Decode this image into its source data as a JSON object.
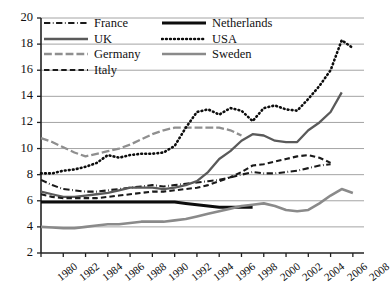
{
  "chart_data": {
    "type": "line",
    "title": "",
    "xlabel": "",
    "ylabel": "share of national income (%)",
    "xlim": [
      1980,
      2009
    ],
    "ylim": [
      2,
      20
    ],
    "ytick_values": [
      2,
      4,
      6,
      8,
      10,
      12,
      14,
      16,
      18,
      20
    ],
    "xtick_values": [
      1980,
      1982,
      1984,
      1986,
      1988,
      1990,
      1992,
      1994,
      1996,
      1998,
      2000,
      2002,
      2004,
      2006,
      2008
    ],
    "ytick_labels": [
      "2",
      "4",
      "6",
      "8",
      "10",
      "12",
      "14",
      "16",
      "18",
      "20"
    ],
    "xtick_labels": [
      "1980",
      "1982",
      "1984",
      "1986",
      "1988",
      "1990",
      "1992",
      "1994",
      "1996",
      "1998",
      "2000",
      "2002",
      "2004",
      "2006",
      "2008"
    ],
    "grid": "horizontal",
    "legend_position": "top-left",
    "series": [
      {
        "name": "France",
        "color": "#1a1a1a",
        "style": "dash-dot",
        "width": 2.1,
        "x": [
          1980,
          1981,
          1982,
          1983,
          1984,
          1985,
          1986,
          1987,
          1988,
          1989,
          1990,
          1991,
          1992,
          1993,
          1994,
          1995,
          1996,
          1997,
          1998,
          1999,
          2000,
          2001,
          2002,
          2003,
          2004,
          2005,
          2006
        ],
        "y": [
          7.6,
          7.2,
          6.9,
          6.8,
          6.7,
          6.7,
          6.8,
          6.9,
          7.0,
          7.1,
          7.2,
          7.1,
          7.2,
          7.3,
          7.4,
          7.5,
          7.6,
          7.8,
          8.0,
          8.2,
          8.1,
          8.1,
          8.2,
          8.3,
          8.5,
          8.7,
          8.8
        ]
      },
      {
        "name": "UK",
        "color": "#5a5a5a",
        "style": "solid",
        "width": 2.3,
        "x": [
          1980,
          1981,
          1982,
          1983,
          1984,
          1985,
          1986,
          1987,
          1988,
          1989,
          1990,
          1991,
          1992,
          1993,
          1994,
          1995,
          1996,
          1997,
          1998,
          1999,
          2000,
          2001,
          2002,
          2003,
          2004,
          2005,
          2006,
          2007
        ],
        "y": [
          6.7,
          6.5,
          6.3,
          6.3,
          6.4,
          6.5,
          6.6,
          6.8,
          7.0,
          7.0,
          7.0,
          6.9,
          7.0,
          7.2,
          7.5,
          8.2,
          9.2,
          9.8,
          10.6,
          11.1,
          11.0,
          10.6,
          10.5,
          10.5,
          11.4,
          12.0,
          12.8,
          14.3
        ]
      },
      {
        "name": "Germany",
        "color": "#8f8f8f",
        "style": "long-dash",
        "width": 2.3,
        "x": [
          1980,
          1981,
          1982,
          1983,
          1984,
          1985,
          1986,
          1987,
          1988,
          1989,
          1990,
          1991,
          1992,
          1993,
          1994,
          1995,
          1996,
          1997,
          1998
        ],
        "y": [
          10.8,
          10.5,
          10.1,
          9.7,
          9.4,
          9.6,
          9.8,
          10.0,
          10.3,
          10.7,
          11.1,
          11.4,
          11.6,
          11.6,
          11.6,
          11.6,
          11.6,
          11.4,
          11.0
        ]
      },
      {
        "name": "Italy",
        "color": "#1a1a1a",
        "style": "dash",
        "width": 2.1,
        "x": [
          1980,
          1981,
          1982,
          1983,
          1984,
          1985,
          1986,
          1987,
          1988,
          1989,
          1990,
          1991,
          1992,
          1993,
          1994,
          1995,
          1996,
          1997,
          1998,
          1999,
          2000,
          2001,
          2002,
          2003,
          2004,
          2005,
          2006
        ],
        "y": [
          6.5,
          6.3,
          6.2,
          6.2,
          6.2,
          6.2,
          6.3,
          6.4,
          6.5,
          6.6,
          6.7,
          6.7,
          6.8,
          6.9,
          7.0,
          7.2,
          7.5,
          7.8,
          8.2,
          8.7,
          8.8,
          9.0,
          9.2,
          9.4,
          9.5,
          9.3,
          8.9
        ]
      },
      {
        "name": "Netherlands",
        "color": "#0d0d0d",
        "style": "solid",
        "width": 3.0,
        "x": [
          1980,
          1981,
          1982,
          1983,
          1984,
          1985,
          1986,
          1987,
          1988,
          1989,
          1990,
          1991,
          1992,
          1993,
          1994,
          1995,
          1996,
          1997,
          1998,
          1999
        ],
        "y": [
          5.9,
          5.9,
          5.9,
          5.9,
          5.9,
          5.9,
          5.9,
          5.9,
          5.9,
          5.9,
          5.9,
          5.9,
          5.9,
          5.8,
          5.7,
          5.6,
          5.5,
          5.5,
          5.5,
          5.5
        ]
      },
      {
        "name": "USA",
        "color": "#0d0d0d",
        "style": "dot",
        "width": 2.6,
        "x": [
          1980,
          1981,
          1982,
          1983,
          1984,
          1985,
          1986,
          1987,
          1988,
          1989,
          1990,
          1991,
          1992,
          1993,
          1994,
          1995,
          1996,
          1997,
          1998,
          1999,
          2000,
          2001,
          2002,
          2003,
          2004,
          2005,
          2006,
          2007,
          2008
        ],
        "y": [
          8.1,
          8.1,
          8.3,
          8.4,
          8.6,
          8.9,
          9.5,
          9.3,
          9.5,
          9.6,
          9.6,
          9.7,
          10.2,
          11.6,
          12.8,
          13.0,
          12.6,
          13.1,
          12.9,
          12.1,
          13.1,
          13.3,
          13.0,
          12.9,
          13.8,
          14.8,
          16.0,
          18.3,
          17.7
        ]
      },
      {
        "name": "Sweden",
        "color": "#8a8a8a",
        "style": "solid",
        "width": 2.6,
        "x": [
          1980,
          1981,
          1982,
          1983,
          1984,
          1985,
          1986,
          1987,
          1988,
          1989,
          1990,
          1991,
          1992,
          1993,
          1994,
          1995,
          1996,
          1997,
          1998,
          1999,
          2000,
          2001,
          2002,
          2003,
          2004,
          2005,
          2006,
          2007,
          2008
        ],
        "y": [
          4.0,
          3.95,
          3.9,
          3.9,
          4.0,
          4.1,
          4.2,
          4.2,
          4.3,
          4.4,
          4.4,
          4.4,
          4.5,
          4.6,
          4.8,
          5.0,
          5.2,
          5.4,
          5.6,
          5.7,
          5.8,
          5.6,
          5.3,
          5.2,
          5.3,
          5.8,
          6.4,
          6.9,
          6.6
        ]
      }
    ]
  },
  "legend": {
    "items": [
      {
        "label": "France",
        "key": "France"
      },
      {
        "label": "Netherlands",
        "key": "Netherlands"
      },
      {
        "label": "UK",
        "key": "UK"
      },
      {
        "label": "USA",
        "key": "USA"
      },
      {
        "label": "Germany",
        "key": "Germany"
      },
      {
        "label": "Sweden",
        "key": "Sweden"
      },
      {
        "label": "Italy",
        "key": "Italy"
      }
    ]
  }
}
